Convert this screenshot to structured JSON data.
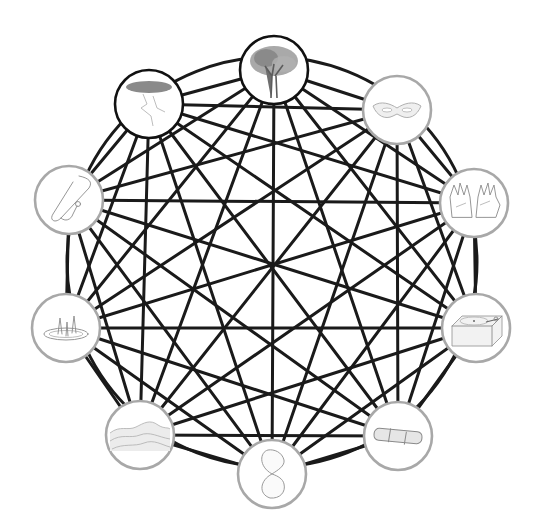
{
  "diagram": {
    "type": "complete-graph",
    "center": [
      272,
      262
    ],
    "outer_ring_radius": 205,
    "node_radius": 34,
    "edge_color": "#1a1a1a",
    "node_border_dark": "#111111",
    "node_border_light": "#a8a8a8",
    "nodes": [
      {
        "id": "tree",
        "label": "Tree",
        "icon": "tree-icon",
        "x": 274,
        "y": 70,
        "border": "dark"
      },
      {
        "id": "mask",
        "label": "Mask",
        "icon": "mask-icon",
        "x": 397,
        "y": 110,
        "border": "light"
      },
      {
        "id": "hands",
        "label": "Hands",
        "icon": "hands-icon",
        "x": 474,
        "y": 203,
        "border": "light"
      },
      {
        "id": "turntable",
        "label": "Turntable",
        "icon": "turntable-icon",
        "x": 476,
        "y": 328,
        "border": "light"
      },
      {
        "id": "bandage",
        "label": "Bandage",
        "icon": "bandage-icon",
        "x": 398,
        "y": 436,
        "border": "light"
      },
      {
        "id": "hourglass",
        "label": "Hourglass",
        "icon": "hourglass-icon",
        "x": 272,
        "y": 474,
        "border": "light"
      },
      {
        "id": "hills",
        "label": "Hills",
        "icon": "hills-icon",
        "x": 140,
        "y": 435,
        "border": "light"
      },
      {
        "id": "fountain",
        "label": "Fountain",
        "icon": "fountain-icon",
        "x": 66,
        "y": 328,
        "border": "light"
      },
      {
        "id": "stethoscope",
        "label": "Stethoscope",
        "icon": "stethoscope-icon",
        "x": 69,
        "y": 200,
        "border": "light"
      },
      {
        "id": "storm-cloud",
        "label": "Storm cloud",
        "icon": "storm-cloud-icon",
        "x": 149,
        "y": 104,
        "border": "dark"
      }
    ],
    "edges": "all-pairs"
  }
}
